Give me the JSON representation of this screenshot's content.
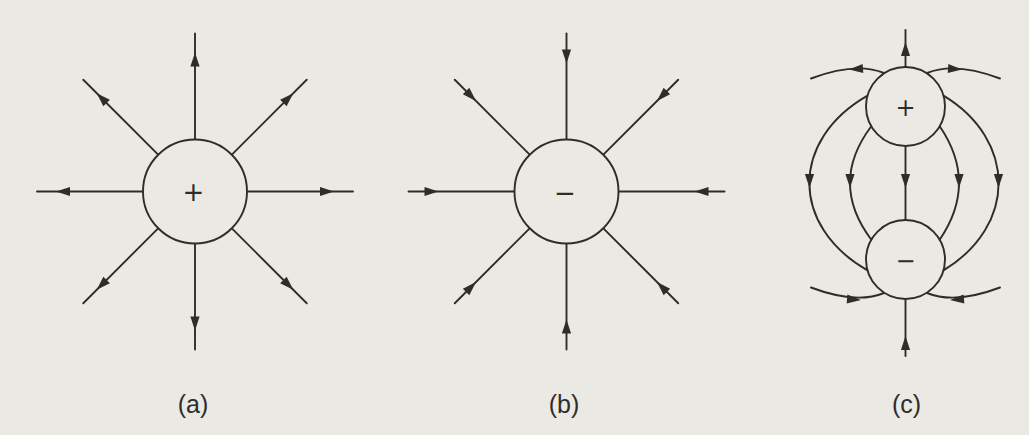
{
  "figure": {
    "background_color": "#eae9e4",
    "line_color": "#2f2d2a",
    "panels": [
      {
        "label": "(a)",
        "charge": {
          "sign": "+",
          "name": "positive-point-charge"
        },
        "field_lines": {
          "count": 8,
          "direction": "outward"
        }
      },
      {
        "label": "(b)",
        "charge": {
          "sign": "−",
          "name": "negative-point-charge"
        },
        "field_lines": {
          "count": 8,
          "direction": "inward"
        }
      },
      {
        "label": "(c)",
        "charges": [
          {
            "sign": "+",
            "name": "positive-charge"
          },
          {
            "sign": "−",
            "name": "negative-charge"
          }
        ],
        "field_lines": {
          "direction": "positive-to-negative"
        }
      }
    ]
  }
}
